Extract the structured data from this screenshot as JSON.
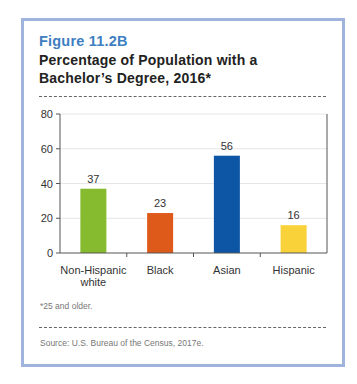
{
  "figure": {
    "label": "Figure 11.2B",
    "title": "Percentage of Population with a Bachelor’s Degree, 2016*",
    "footnote": "*25 and older.",
    "source": "Source: U.S. Bureau of the Census, 2017e."
  },
  "colors": {
    "frame": "#9fb3dc",
    "label": "#3d7fc0",
    "non_hispanic_white": "#86bb2f",
    "black": "#de5a1b",
    "asian": "#0d56a6",
    "hispanic": "#f9d23a"
  },
  "chart_data": {
    "type": "bar",
    "title": "Percentage of Population with a Bachelor’s Degree, 2016*",
    "categories": [
      "Non-Hispanic white",
      "Black",
      "Asian",
      "Hispanic"
    ],
    "category_lines": [
      [
        "Non-Hispanic",
        "white"
      ],
      [
        "Black"
      ],
      [
        "Asian"
      ],
      [
        "Hispanic"
      ]
    ],
    "values": [
      37,
      23,
      56,
      16
    ],
    "bar_colors": [
      "#86bb2f",
      "#de5a1b",
      "#0d56a6",
      "#f9d23a"
    ],
    "xlabel": "",
    "ylabel": "",
    "ylim": [
      0,
      80
    ],
    "yticks": [
      0,
      20,
      40,
      60,
      80
    ],
    "grid": true,
    "data_labels": true,
    "legend": "none"
  }
}
